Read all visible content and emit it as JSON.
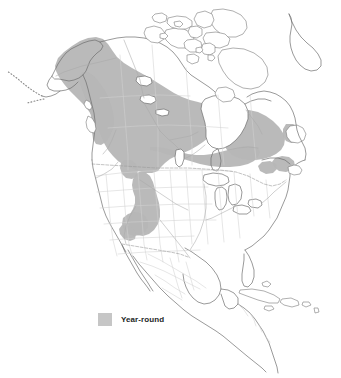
{
  "figure": {
    "type": "range-map",
    "region": "North America",
    "background_color": "#ffffff",
    "title": ""
  },
  "legend": {
    "position": "bottom-left",
    "items": [
      {
        "label": "Year-round",
        "swatch_color": "#c6c6c6",
        "icon": "legend-color-swatch"
      }
    ]
  },
  "map": {
    "colors": {
      "range_fill": "#b6b6b6",
      "coastline": "#6e6e6e",
      "subdivision_border": "#d2d2d2",
      "river": "#a9a9a9",
      "international_border_dashed": "#9a9a9a",
      "land_fill": "#ffffff",
      "water_fill": "#ffffff"
    },
    "features": {
      "coastlines": "north-america-coastline",
      "arctic_archipelago": "canadian-arctic-islands",
      "greenland_west_coast": "greenland-coastline",
      "aleutian_chain": "aleutian-islands-dotted",
      "great_lakes": "great-lakes-outline",
      "hudson_bay": "hudson-bay-outline",
      "state_province_borders": "subdivision-lines",
      "rivers": "river-network",
      "us_canada_border": "dashed-49th-parallel"
    },
    "range_description": "Shaded year-round distribution across boreal Alaska, western and central Canada, around Hudson Bay to Quebec, Labrador and Newfoundland, with a southern extension along the Rocky Mountains into the Great Basin"
  }
}
